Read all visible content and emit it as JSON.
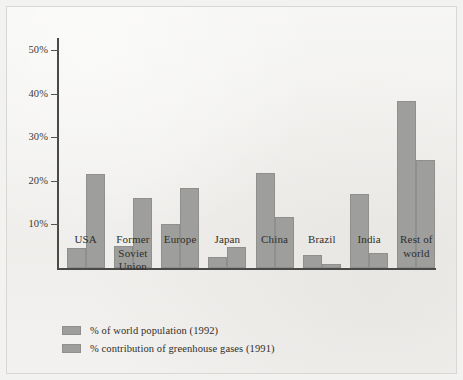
{
  "chart_data": {
    "type": "bar",
    "title": "",
    "subtitle": "",
    "xlabel": "",
    "ylabel": "",
    "ylim": [
      0,
      55
    ],
    "grid": false,
    "legend_position": "bottom-left",
    "y_ticks": [
      "10%",
      "20%",
      "30%",
      "40%",
      "50%"
    ],
    "y_tick_values": [
      10,
      20,
      30,
      40,
      50
    ],
    "categories": [
      "USA",
      "Former Soviet Union",
      "Europe",
      "Japan",
      "China",
      "Brazil",
      "India",
      "Rest of world"
    ],
    "category_labels": [
      "USA",
      "Former\nSoviet\nUnion",
      "Europe",
      "Japan",
      "China",
      "Brazil",
      "India",
      "Rest of\nworld"
    ],
    "series": [
      {
        "name": "% of world population (1992)",
        "color": "#9e9e9c",
        "values": [
          4.6,
          5.1,
          10.0,
          2.5,
          21.9,
          3.0,
          17.0,
          38.3
        ]
      },
      {
        "name": "% contribution of greenhouse gases (1991)",
        "color": "#9e9e9c",
        "values": [
          21.5,
          16.0,
          18.3,
          4.9,
          11.6,
          1.0,
          3.5,
          24.7
        ]
      }
    ]
  },
  "legend": {
    "items": [
      {
        "label": "% of world population (1992)"
      },
      {
        "label": "% contribution of greenhouse gases (1991)"
      }
    ]
  },
  "axis": {
    "bar_fill": "#9e9e9c",
    "axis_color": "#4a4a48"
  }
}
